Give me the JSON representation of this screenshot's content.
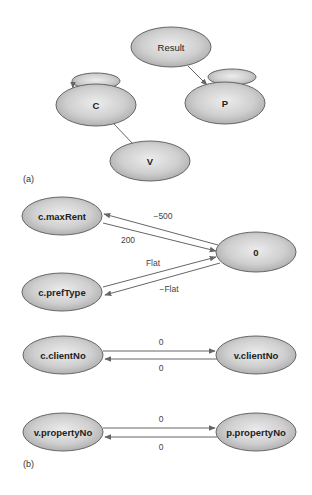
{
  "figure": {
    "part_a": {
      "label": "(a)",
      "nodes": [
        {
          "id": "result",
          "label": "Result"
        },
        {
          "id": "c",
          "label": "C"
        },
        {
          "id": "p",
          "label": "P"
        },
        {
          "id": "v",
          "label": "V"
        }
      ],
      "edges": [
        {
          "from": "result",
          "to": "p",
          "directed": true
        },
        {
          "from": "c",
          "to": "v",
          "directed": false
        },
        {
          "from": "c",
          "to": "c",
          "self_loop": true
        },
        {
          "from": "p",
          "to": "p",
          "self_loop": true
        }
      ]
    },
    "part_b": {
      "label": "(b)",
      "groups": [
        {
          "nodes": [
            "c.maxRent",
            "c.prefType",
            "0"
          ],
          "edges": [
            {
              "from": "0",
              "to": "c.maxRent",
              "label": "−500"
            },
            {
              "from": "c.maxRent",
              "to": "0",
              "label": "200"
            },
            {
              "from": "c.prefType",
              "to": "0",
              "label": "Flat"
            },
            {
              "from": "0",
              "to": "c.prefType",
              "label": "−Flat"
            }
          ]
        },
        {
          "nodes": [
            "c.clientNo",
            "v.clientNo"
          ],
          "edges": [
            {
              "from": "c.clientNo",
              "to": "v.clientNo",
              "label": "0"
            },
            {
              "from": "v.clientNo",
              "to": "c.clientNo",
              "label": "0"
            }
          ]
        },
        {
          "nodes": [
            "v.propertyNo",
            "p.propertyNo"
          ],
          "edges": [
            {
              "from": "v.propertyNo",
              "to": "p.propertyNo",
              "label": "0"
            },
            {
              "from": "p.propertyNo",
              "to": "v.propertyNo",
              "label": "0"
            }
          ]
        }
      ]
    }
  },
  "labels": {
    "result": "Result",
    "c": "C",
    "p": "P",
    "v": "V",
    "part_a": "(a)",
    "part_b": "(b)",
    "maxRent": "c.maxRent",
    "prefType": "c.prefType",
    "zero": "0",
    "e_minus500": "−500",
    "e_200": "200",
    "e_flat": "Flat",
    "e_minusflat": "−Flat",
    "cClientNo": "c.clientNo",
    "vClientNo": "v.clientNo",
    "e_cv_top": "0",
    "e_cv_bottom": "0",
    "vPropertyNo": "v.propertyNo",
    "pPropertyNo": "p.propertyNo",
    "e_vp_top": "0",
    "e_vp_bottom": "0"
  },
  "colors": {
    "node_fill_light": "#e6e6e6",
    "node_fill_dark": "#a9a9a9",
    "stroke": "#555555",
    "edge": "#666666"
  }
}
